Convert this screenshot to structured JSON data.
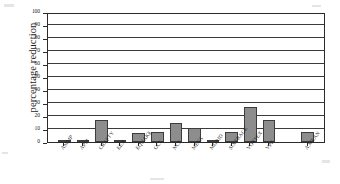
{
  "chart_data": {
    "type": "bar",
    "title": "",
    "subtitle": "",
    "xlabel": "",
    "ylabel": "percentage reduction",
    "ylim": [
      0,
      100
    ],
    "yticks": [
      0,
      10,
      20,
      30,
      40,
      50,
      60,
      70,
      80,
      90,
      100
    ],
    "ytick_labels": [
      "0",
      "10",
      "20",
      "30",
      "40",
      "50",
      "60",
      "70",
      "80",
      "90",
      "100"
    ],
    "grid": true,
    "legend": null,
    "legend_position": "none",
    "bar_color": "#8d8d8d",
    "bar_edge_color": "#3c3c3c",
    "axis_color": "#2b2b2b",
    "categories": [
      "AMMP",
      "APSI",
      "CRAFTY",
      "EEX",
      "EQUAKE",
      "GCC",
      "NCF",
      "MESA",
      "MGRID",
      "SIXTRACK",
      "VORTEX",
      "VPR",
      "A.MEAN"
    ],
    "values": [
      1,
      1,
      17,
      1,
      7,
      8,
      15,
      10.5,
      1,
      8,
      27,
      17,
      8
    ],
    "annotations": [
      "last category A.MEAN is separated from the others by a gap"
    ]
  }
}
